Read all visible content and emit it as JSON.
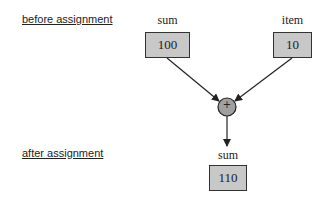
{
  "labels": {
    "before": "before assignment",
    "after": "after assignment"
  },
  "variables": {
    "sum_before": {
      "name": "sum",
      "value": "100"
    },
    "item": {
      "name": "item",
      "value": "10"
    },
    "sum_after": {
      "name": "sum",
      "value": "110"
    }
  },
  "operator": {
    "symbol": "+"
  },
  "colors": {
    "box_fill": "#c8c8c8",
    "operator_fill": "#a0a0a0",
    "stroke": "#222222"
  }
}
